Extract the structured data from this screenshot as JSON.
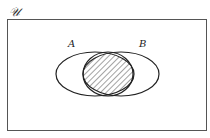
{
  "diagram": {
    "type": "venn",
    "universe_label": "𝒰",
    "sets": [
      {
        "label": "A"
      },
      {
        "label": "B"
      }
    ],
    "shaded_region": "A ∩ B",
    "colors": {
      "stroke": "#222222",
      "hatch": "#333333",
      "frame": "#555555"
    }
  }
}
